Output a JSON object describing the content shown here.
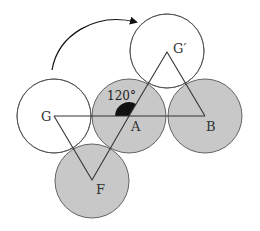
{
  "diagram": {
    "type": "geometry-rotation",
    "colors": {
      "shaded_fill": "#c8c8c8",
      "outline": "#555555",
      "line": "#333333",
      "angle_fill": "#111111",
      "background": "#ffffff"
    },
    "circles": [
      {
        "id": "G",
        "cx": 54,
        "cy": 116,
        "r": 37,
        "shaded": false
      },
      {
        "id": "A",
        "cx": 129,
        "cy": 116,
        "r": 37,
        "shaded": true
      },
      {
        "id": "B",
        "cx": 205,
        "cy": 116,
        "r": 37,
        "shaded": true
      },
      {
        "id": "G_prime",
        "cx": 167,
        "cy": 51,
        "r": 37,
        "shaded": false
      },
      {
        "id": "F",
        "cx": 92,
        "cy": 181,
        "r": 37,
        "shaded": true
      }
    ],
    "points": {
      "G": {
        "label": "G",
        "x": 54,
        "y": 116
      },
      "A": {
        "label": "A",
        "x": 129,
        "y": 116
      },
      "B": {
        "label": "B",
        "x": 205,
        "y": 116
      },
      "G_prime": {
        "label": "G′",
        "x": 167,
        "y": 52
      },
      "F": {
        "label": "F",
        "x": 92,
        "y": 180
      }
    },
    "angle_label": "120°",
    "rotation_arrow": "clockwise-rotation-arrow"
  }
}
